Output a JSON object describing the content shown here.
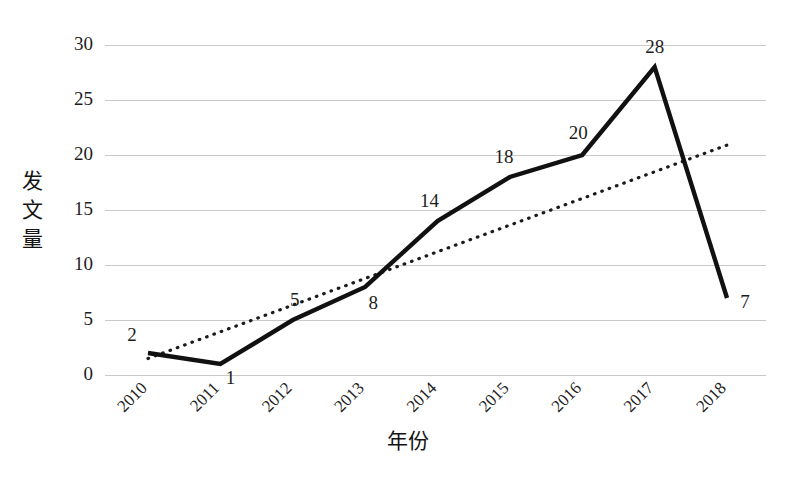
{
  "chart_data": {
    "type": "line",
    "title": "",
    "xlabel": "年份",
    "ylabel": "发文量",
    "categories": [
      "2010",
      "2011",
      "2012",
      "2013",
      "2014",
      "2015",
      "2016",
      "2017",
      "2018"
    ],
    "values": [
      2,
      1,
      5,
      8,
      14,
      18,
      20,
      28,
      7
    ],
    "data_labels": [
      "2",
      "1",
      "5",
      "8",
      "14",
      "18",
      "20",
      "28",
      "7"
    ],
    "ylim": [
      0,
      30
    ],
    "ytick_step": 5,
    "ytick_labels": [
      "0",
      "5",
      "10",
      "15",
      "20",
      "25",
      "30"
    ],
    "grid": "horizontal",
    "legend": "none",
    "series": [
      {
        "name": "发文量",
        "style": "solid-thick-black",
        "color": "#111111",
        "values": [
          2,
          1,
          5,
          8,
          14,
          18,
          20,
          28,
          7
        ]
      },
      {
        "name": "趋势线",
        "style": "dotted-trendline",
        "color": "#1b1b1b",
        "start_value": 1.5,
        "end_value": 21.0
      }
    ],
    "xtick_rotation_deg": 45,
    "ylabel_orientation": "vertical-stacked-characters",
    "ylabel_chars": [
      "发",
      "文",
      "量"
    ]
  },
  "colors": {
    "background": "#ffffff",
    "line": "#111111",
    "trend": "#1b1b1b",
    "grid": "#c9c9c9",
    "text": "#1a1a1a"
  }
}
